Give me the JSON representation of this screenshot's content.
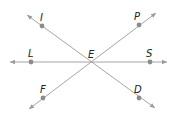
{
  "diagram": {
    "type": "intersecting-lines",
    "colors": {
      "line": "#9a9a9a",
      "point": "#8c8c8c",
      "label": "#222222",
      "background": "#ffffff"
    },
    "center": {
      "label": "E",
      "x": 91,
      "y": 62,
      "label_x": 88,
      "label_y": 58
    },
    "lines": [
      {
        "name": "line-LS",
        "x1": 10,
        "y1": 62,
        "x2": 167,
        "y2": 62
      },
      {
        "name": "line-ID",
        "x1": 27,
        "y1": 15,
        "x2": 155,
        "y2": 108
      },
      {
        "name": "line-PF",
        "x1": 156,
        "y1": 13,
        "x2": 29,
        "y2": 109
      }
    ],
    "points": [
      {
        "label": "I",
        "x": 42,
        "y": 26,
        "label_x": 40,
        "label_y": 21
      },
      {
        "label": "P",
        "x": 139,
        "y": 25,
        "label_x": 134,
        "label_y": 20
      },
      {
        "label": "L",
        "x": 31,
        "y": 62,
        "label_x": 28,
        "label_y": 57
      },
      {
        "label": "S",
        "x": 150,
        "y": 62,
        "label_x": 146,
        "label_y": 57
      },
      {
        "label": "F",
        "x": 43,
        "y": 98,
        "label_x": 40,
        "label_y": 93
      },
      {
        "label": "D",
        "x": 139,
        "y": 98,
        "label_x": 134,
        "label_y": 93
      }
    ]
  }
}
